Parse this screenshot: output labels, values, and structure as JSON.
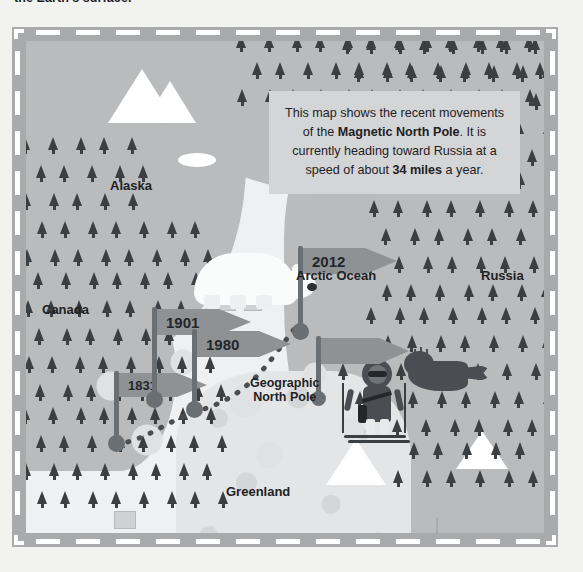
{
  "page": {
    "caption_cutoff": "the Earth's surface."
  },
  "info_box": {
    "name": "magnetic-north-pole-callout",
    "line1": "This map shows the recent movements",
    "line2_pre": "of the ",
    "line2_bold": "Magnetic North Pole",
    "line2_post": ". It is",
    "line3": "currently heading toward Russia at a",
    "line4_pre": "speed of about ",
    "line4_bold": "34 miles",
    "line4_post": " a year."
  },
  "map": {
    "region_labels": [
      {
        "id": "alaska",
        "text": "Alaska",
        "x": 84,
        "y": 138,
        "size": 13
      },
      {
        "id": "canada",
        "text": "Canada",
        "x": 16,
        "y": 262,
        "size": 13
      },
      {
        "id": "russia",
        "text": "Russia",
        "x": 455,
        "y": 228,
        "size": 13
      },
      {
        "id": "greenland",
        "text": "Greenland",
        "x": 200,
        "y": 444,
        "size": 13
      },
      {
        "id": "arctic-ocean",
        "text": "Arctic Ocean",
        "x": 270,
        "y": 228,
        "size": 13
      }
    ],
    "pole_label": {
      "id": "geographic-north-pole",
      "line1": "Geographic",
      "line2": "North Pole",
      "x": 224,
      "y": 335,
      "size": 12.5
    },
    "flags": [
      {
        "year": "1831",
        "pole_x": 88,
        "pole_y": 330,
        "pole_h": 72,
        "banner_w": 58,
        "banner_h": 24,
        "dot": 17
      },
      {
        "year": "1901",
        "pole_x": 126,
        "pole_y": 266,
        "pole_h": 92,
        "banner_w": 62,
        "banner_h": 26,
        "dot": 17
      },
      {
        "year": "1980",
        "pole_x": 166,
        "pole_y": 288,
        "pole_h": 80,
        "banner_w": 62,
        "banner_h": 26,
        "dot": 17
      },
      {
        "year": "2012",
        "pole_x": 272,
        "pole_y": 205,
        "pole_h": 85,
        "banner_w": 62,
        "banner_h": 26,
        "dot": 17
      }
    ],
    "unlabeled_flag": {
      "pole_x": 290,
      "pole_y": 295,
      "pole_h": 62,
      "banner_w": 58,
      "banner_h": 26,
      "dot": 15
    },
    "drift_path_note": "dotted trail connecting 1831 → 1901 → 1980 → 2012 markers",
    "illustrations": [
      {
        "id": "polar-bear",
        "label": "polar bear"
      },
      {
        "id": "walrus",
        "label": "walrus"
      },
      {
        "id": "whale",
        "label": "whale"
      },
      {
        "id": "skier",
        "label": "skier in parka"
      },
      {
        "id": "mountains",
        "label": "snow-capped mountains"
      },
      {
        "id": "forest",
        "label": "coniferous forest"
      }
    ]
  },
  "colors": {
    "frame": "#a9aaac",
    "frame_dash": "#ffffff",
    "ocean": "#eef0f1",
    "land": "#b9bbbc",
    "ice": "#e3e5e6",
    "tree": "#3b3f42",
    "flag": "#8e9295",
    "pole": "#6a6f73",
    "text": "#1f2124",
    "callout_bg": "#d3d5d6",
    "page_bg": "#f2f2f0"
  }
}
